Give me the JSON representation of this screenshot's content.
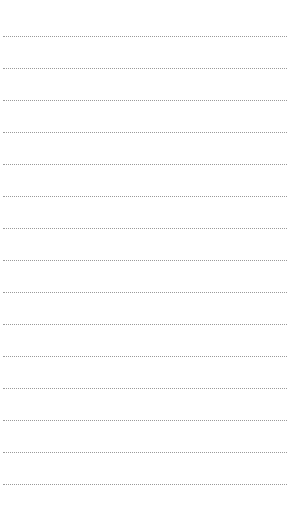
{
  "page": {
    "type": "lined-paper",
    "background_color": "#ffffff",
    "line_color": "#9a9a9a",
    "line_style": "dotted",
    "line_count": 15,
    "first_line_y": 36,
    "line_spacing": 32,
    "line_left": 3,
    "line_width": 284
  }
}
